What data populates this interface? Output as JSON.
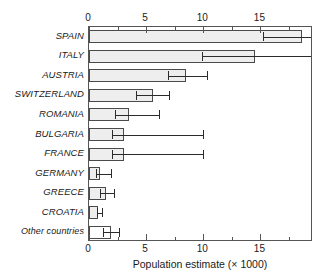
{
  "chart_data": {
    "type": "bar",
    "orientation": "horizontal",
    "title": "",
    "xlabel": "Population estimate (× 1000)",
    "ylabel": "",
    "xlim": [
      0,
      19.6
    ],
    "xticks": [
      0,
      5,
      10,
      15
    ],
    "xticklabels": [
      "0",
      "5",
      "10",
      "15"
    ],
    "minor_tick_step": 2.5,
    "grid": false,
    "legend": null,
    "axis_top": true,
    "axis_bottom": true,
    "categories": [
      "SPAIN",
      "ITALY",
      "AUSTRIA",
      "SWITZERLAND",
      "ROMANIA",
      "BULGARIA",
      "FRANCE",
      "GERMANY",
      "GREECE",
      "CROATIA",
      "Other countries"
    ],
    "values": [
      18.6,
      14.5,
      8.5,
      5.6,
      3.5,
      3.1,
      3.1,
      1.0,
      1.5,
      0.8,
      1.9
    ],
    "error_low": [
      15.2,
      9.9,
      6.9,
      4.1,
      2.3,
      2.0,
      2.0,
      0.6,
      1.0,
      0.7,
      1.2
    ],
    "error_high": [
      19.6,
      19.6,
      10.3,
      7.0,
      6.1,
      10.0,
      10.0,
      1.9,
      2.2,
      1.1,
      2.6
    ],
    "bar_fill": [
      "filled",
      "filled",
      "filled",
      "filled",
      "filled",
      "filled",
      "filled",
      "filled",
      "filled",
      "filled",
      "unfilled"
    ],
    "colors": {
      "bar_fill": "#eeeeee",
      "bar_fill_alt": "#ffffff",
      "bar_edge": "#4a4a4a",
      "error": "#2b2b2b",
      "axis": "#555555",
      "text": "#1a1a1a",
      "background": "#ffffff"
    }
  }
}
